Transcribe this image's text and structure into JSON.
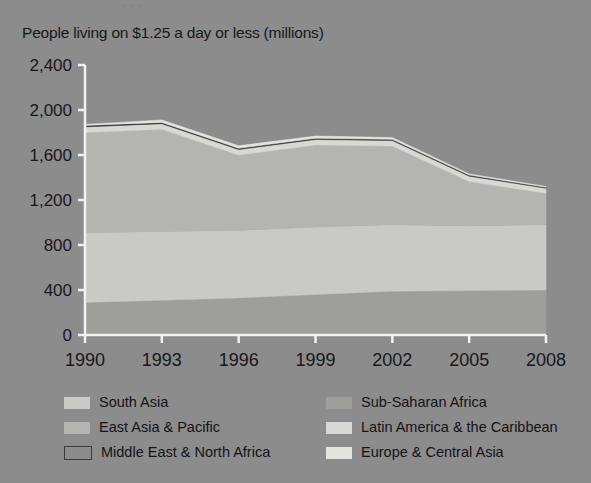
{
  "figure": {
    "background_color": "#8c8c8c",
    "clipped_header_text": "· · ·",
    "title": "People living on $1.25 a day or less (millions)"
  },
  "axes": {
    "y_ticks": [
      "0",
      "400",
      "800",
      "1,200",
      "1,600",
      "2,000",
      "2,400"
    ],
    "x_ticks": [
      "1990",
      "1993",
      "1996",
      "1999",
      "2002",
      "2005",
      "2008"
    ],
    "axis_color": "#f2f2f2"
  },
  "legend": {
    "items": [
      {
        "label": "South Asia",
        "color": "#c9c9c6",
        "style": "filled",
        "column": "left"
      },
      {
        "label": "Sub-Saharan Africa",
        "color": "#9e9e9b",
        "style": "filled",
        "column": "right"
      },
      {
        "label": "East Asia & Pacific",
        "color": "#b4b4b1",
        "style": "filled",
        "column": "left"
      },
      {
        "label": "Latin America & the Caribbean",
        "color": "#d8d8d5",
        "style": "filled",
        "column": "right"
      },
      {
        "label": "Middle East & North Africa",
        "color": "#3b3b3d",
        "style": "outlined",
        "column": "left"
      },
      {
        "label": "Europe & Central Asia",
        "color": "#e4e4e1",
        "style": "filled",
        "column": "right"
      }
    ]
  },
  "chart_data": {
    "type": "area",
    "stacked": true,
    "title": "People living on $1.25 a day or less (millions)",
    "xlabel": "",
    "ylabel": "People living on $1.25 a day or less (millions)",
    "ylim": [
      0,
      2400
    ],
    "xlim": [
      1990,
      2008
    ],
    "grid": false,
    "legend_position": "bottom",
    "x": [
      1990,
      1993,
      1996,
      1999,
      2002,
      2005,
      2008
    ],
    "categories": [
      "1990",
      "1993",
      "1996",
      "1999",
      "2002",
      "2005",
      "2008"
    ],
    "series": [
      {
        "name": "Sub-Saharan Africa",
        "color": "#9e9e9b",
        "values": [
          290,
          310,
          330,
          360,
          390,
          395,
          400
        ]
      },
      {
        "name": "South Asia",
        "color": "#c9c9c6",
        "values": [
          620,
          610,
          600,
          600,
          590,
          575,
          580
        ]
      },
      {
        "name": "East Asia & Pacific",
        "color": "#b4b4b1",
        "values": [
          890,
          910,
          670,
          730,
          700,
          395,
          280
        ]
      },
      {
        "name": "Latin America & the Caribbean",
        "color": "#d8d8d5",
        "values": [
          50,
          48,
          48,
          48,
          48,
          47,
          45
        ]
      },
      {
        "name": "Middle East & North Africa",
        "color": "#3b3b3d",
        "values": [
          13,
          12,
          12,
          11,
          11,
          10,
          9
        ]
      },
      {
        "name": "Europe & Central Asia",
        "color": "#e4e4e1",
        "values": [
          9,
          22,
          22,
          20,
          16,
          10,
          6
        ]
      }
    ],
    "totals": [
      1872,
      1912,
      1682,
      1769,
      1755,
      1432,
      1320
    ]
  }
}
